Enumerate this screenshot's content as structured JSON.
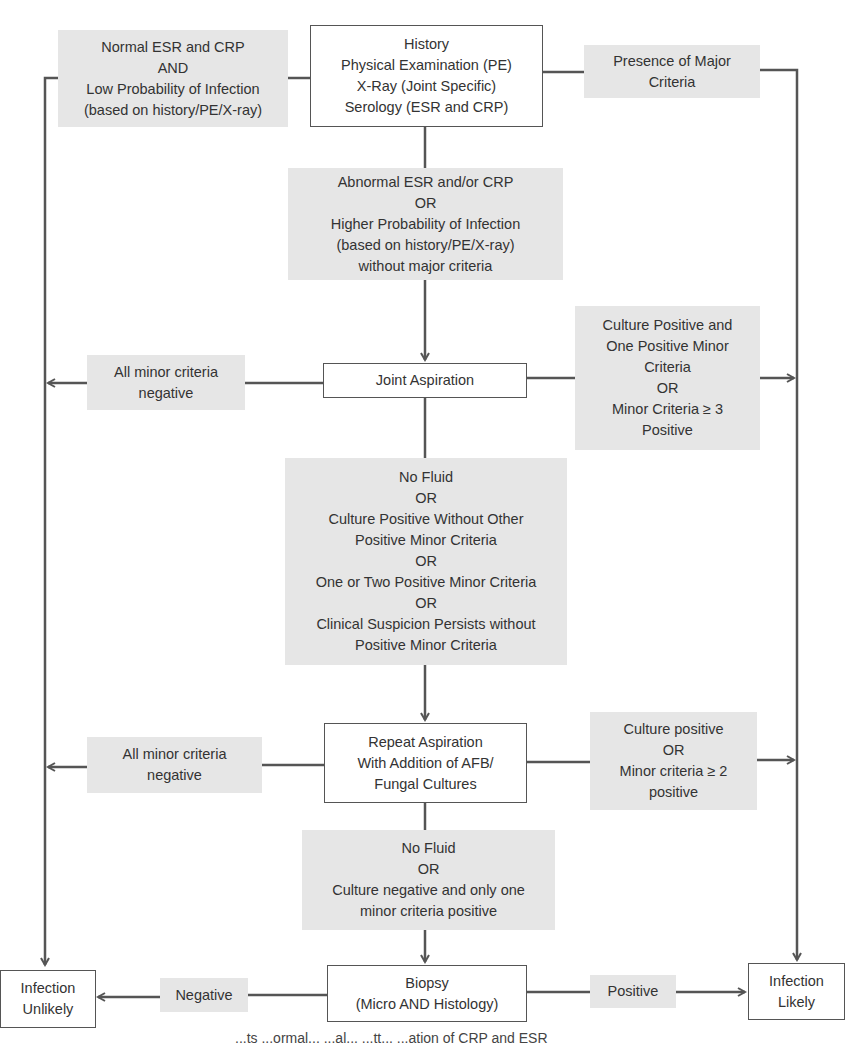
{
  "diagram": {
    "type": "flowchart",
    "colors": {
      "line": "#555555",
      "gray_fill": "#e6e6e6",
      "box_fill": "#ffffff",
      "text": "#333333"
    },
    "nodes": {
      "start": {
        "lines": [
          "History",
          "Physical Examination (PE)",
          "X-Ray (Joint Specific)",
          "Serology (ESR and CRP)"
        ]
      },
      "low_prob": {
        "lines": [
          "Normal ESR and CRP",
          "AND",
          "Low Probability of Infection",
          "(based on history/PE/X-ray)"
        ]
      },
      "major": {
        "lines": [
          "Presence of Major",
          "Criteria"
        ]
      },
      "abnormal": {
        "lines": [
          "Abnormal ESR and/or CRP",
          "OR",
          "Higher Probability of Infection",
          "(based on history/PE/X-ray)",
          "without major criteria"
        ]
      },
      "joint_aspiration": {
        "lines": [
          "Joint Aspiration"
        ]
      },
      "ja_negative": {
        "lines": [
          "All minor criteria",
          "negative"
        ]
      },
      "ja_positive": {
        "lines": [
          "Culture Positive and",
          "One Positive Minor",
          "Criteria",
          "OR",
          "Minor Criteria ≥ 3",
          "Positive"
        ]
      },
      "inconclusive": {
        "lines": [
          "No Fluid",
          "OR",
          "Culture Positive Without Other",
          "Positive Minor Criteria",
          "OR",
          "One or Two Positive Minor Criteria",
          "OR",
          "Clinical Suspicion Persists without",
          "Positive Minor Criteria"
        ]
      },
      "repeat_aspiration": {
        "lines": [
          "Repeat Aspiration",
          "With Addition of AFB/",
          "Fungal Cultures"
        ]
      },
      "ra_negative": {
        "lines": [
          "All minor criteria",
          "negative"
        ]
      },
      "ra_positive": {
        "lines": [
          "Culture positive",
          "OR",
          "Minor criteria  ≥ 2",
          "positive"
        ]
      },
      "inconclusive2": {
        "lines": [
          "No Fluid",
          "OR",
          "Culture negative and only one",
          "minor criteria positive"
        ]
      },
      "biopsy": {
        "lines": [
          "Biopsy",
          "(Micro AND Histology)"
        ]
      },
      "negative": {
        "lines": [
          "Negative"
        ]
      },
      "positive": {
        "lines": [
          "Positive"
        ]
      },
      "unlikely": {
        "lines": [
          "Infection",
          "Unlikely"
        ]
      },
      "likely": {
        "lines": [
          "Infection",
          "Likely"
        ]
      }
    },
    "caption_partial": "...ts ...ormal... ...al...  ...tt... ...ation of CRP and ESR"
  }
}
